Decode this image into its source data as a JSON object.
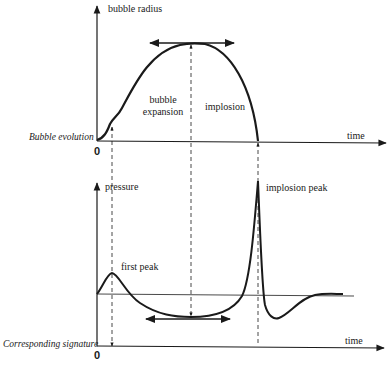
{
  "top_panel": {
    "row_label": "Bubble evolution",
    "y_axis_label": "bubble radius",
    "x_axis_label": "time",
    "origin_label": "0",
    "phase_labels": {
      "expansion_line1": "bubble",
      "expansion_line2": "expansion",
      "implosion": "implosion"
    }
  },
  "bottom_panel": {
    "row_label": "Corresponding signature",
    "y_axis_label": "pressure",
    "x_axis_label": "time",
    "origin_label": "0",
    "annotations": {
      "first_peak": "first peak",
      "implosion_peak": "implosion peak"
    }
  },
  "colors": {
    "ink": "#1a1a1a",
    "background": "#ffffff"
  }
}
